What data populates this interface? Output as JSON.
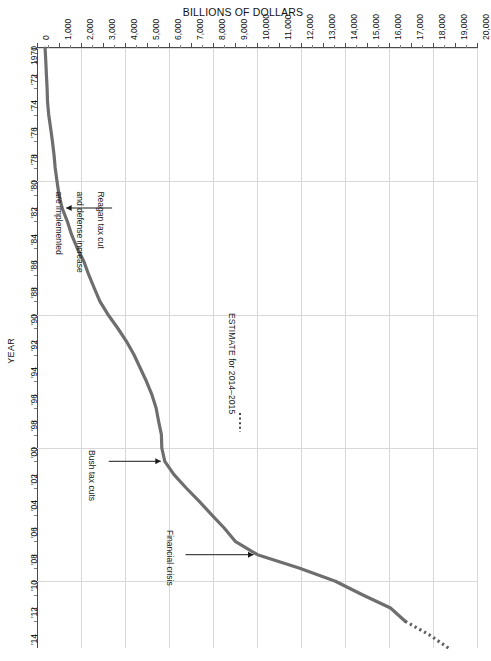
{
  "chart_data": {
    "type": "line",
    "title": "BILLIONS OF DOLLARS",
    "xlabel": "BILLIONS OF DOLLARS",
    "ylabel": "YEAR",
    "orientation": "rotated-90",
    "xlim": [
      0,
      20000
    ],
    "ylim": [
      1970,
      2015
    ],
    "grid": true,
    "legend": "none",
    "value_tick_labels": [
      "0",
      "1,000",
      "2,000",
      "3,000",
      "4,000",
      "5,000",
      "6,000",
      "7,000",
      "8,000",
      "9,000",
      "10,000",
      "11,000",
      "12,000",
      "13,000",
      "14,000",
      "15,000",
      "16,000",
      "17,000",
      "18,000",
      "19,000",
      "20,000"
    ],
    "value_ticks": [
      0,
      1000,
      2000,
      3000,
      4000,
      5000,
      6000,
      7000,
      8000,
      9000,
      10000,
      11000,
      12000,
      13000,
      14000,
      15000,
      16000,
      17000,
      18000,
      19000,
      20000
    ],
    "year_tick_labels": [
      "1970",
      "'72",
      "'74",
      "'76",
      "'78",
      "'80",
      "'82",
      "'84",
      "'86",
      "'88",
      "'90",
      "'92",
      "'94",
      "'96",
      "'98",
      "'00",
      "'02",
      "'04",
      "'06",
      "'08",
      "'10",
      "'12",
      "'14"
    ],
    "year_ticks": [
      1970,
      1972,
      1974,
      1976,
      1978,
      1980,
      1982,
      1984,
      1986,
      1988,
      1990,
      1992,
      1994,
      1996,
      1998,
      2000,
      2002,
      2004,
      2006,
      2008,
      2010,
      2012,
      2014
    ],
    "x": [
      1970,
      1971,
      1972,
      1973,
      1974,
      1975,
      1976,
      1977,
      1978,
      1979,
      1980,
      1981,
      1982,
      1983,
      1984,
      1985,
      1986,
      1987,
      1988,
      1989,
      1990,
      1991,
      1992,
      1993,
      1994,
      1995,
      1996,
      1997,
      1998,
      1999,
      2000,
      2001,
      2002,
      2003,
      2004,
      2005,
      2006,
      2007,
      2008,
      2009,
      2010,
      2011,
      2012,
      2013,
      2014,
      2015
    ],
    "values": [
      370,
      398,
      427,
      458,
      475,
      533,
      620,
      699,
      772,
      827,
      908,
      998,
      1142,
      1377,
      1572,
      1823,
      2125,
      2350,
      2602,
      2857,
      3233,
      3665,
      4065,
      4411,
      4693,
      4974,
      5225,
      5413,
      5526,
      5656,
      5674,
      5807,
      6228,
      6783,
      7379,
      7933,
      8507,
      9008,
      10025,
      11910,
      13562,
      14790,
      16066,
      16738,
      17824,
      18700
    ],
    "annotations": [
      {
        "id": "reagan",
        "text": "Reagan tax cut\nand defense increase\nare implemented",
        "point_year": 1982,
        "point_value": 1142
      },
      {
        "id": "bush",
        "text": "Bush tax cuts",
        "point_year": 2001,
        "point_value": 5807
      },
      {
        "id": "crisis",
        "text": "Financial crisis",
        "point_year": 2008,
        "point_value": 10025
      },
      {
        "id": "estimate",
        "text": "ESTIMATE for 2014–2015",
        "style": "dotted-leader"
      }
    ],
    "series_color": "#6e6e6e",
    "grid_color": "#d8d8d8",
    "axis_color": "#4a4a4a"
  },
  "chart": {
    "title": "BILLIONS OF DOLLARS",
    "year_axis_title": "YEAR",
    "estimate_label": "ESTIMATE for 2014–2015",
    "anno_reagan_line1": "Reagan tax cut",
    "anno_reagan_line2": "and defense increase",
    "anno_reagan_line3": "are implemented",
    "anno_bush": "Bush tax cuts",
    "anno_crisis": "Financial crisis"
  }
}
